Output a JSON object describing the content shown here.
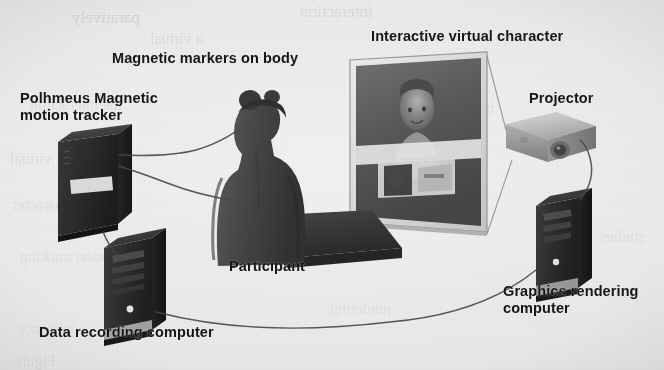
{
  "figure": {
    "type": "system-diagram",
    "medium": "grayscale scanned book figure",
    "background_color": "#eae8e2",
    "ink_color": "#15161a"
  },
  "labels": {
    "magnetic_markers": "Magnetic markers on body",
    "interactive_virtual_character": "Interactive virtual character",
    "motion_tracker": "Polhmeus Magnetic\nmotion tracker",
    "projector": "Projector",
    "participant": "Participant",
    "data_recording_computer": "Data recording computer",
    "graphics_rendering_computer": "Graphics rendering\ncomputer"
  },
  "components": [
    {
      "id": "motion-tracker",
      "label": "Polhmeus Magnetic motion tracker",
      "color": "#2e2d2c"
    },
    {
      "id": "data-recording-computer",
      "label": "Data recording computer",
      "color": "#262524"
    },
    {
      "id": "participant",
      "label": "Participant",
      "color": "#4a4542"
    },
    {
      "id": "projection-screen",
      "label": "Interactive virtual character",
      "color": "#5b5754"
    },
    {
      "id": "projector",
      "label": "Projector",
      "color": "#b9b6b0"
    },
    {
      "id": "graphics-rendering-computer",
      "label": "Graphics rendering computer",
      "color": "#262524"
    },
    {
      "id": "platform",
      "label": "Platform",
      "color": "#3a3836"
    }
  ],
  "connections": [
    {
      "from": "participant",
      "to": "motion-tracker",
      "kind": "marker-cable-upper"
    },
    {
      "from": "participant",
      "to": "motion-tracker",
      "kind": "marker-cable-lower"
    },
    {
      "from": "motion-tracker",
      "to": "data-recording-computer",
      "kind": "data-cable"
    },
    {
      "from": "data-recording-computer",
      "to": "graphics-rendering-computer",
      "kind": "long-data-cable"
    },
    {
      "from": "graphics-rendering-computer",
      "to": "projector",
      "kind": "video-cable"
    },
    {
      "from": "projector",
      "to": "projection-screen",
      "kind": "projection-beam"
    }
  ],
  "bleed_text": [
    {
      "text": "paratively",
      "x": 72,
      "y": 8,
      "size": 17,
      "rot": 0,
      "op": 0.5
    },
    {
      "text": "interaction",
      "x": 300,
      "y": 2,
      "size": 17,
      "rot": 0,
      "op": 0.45
    },
    {
      "text": "a virtual",
      "x": 150,
      "y": 30,
      "size": 16,
      "rot": 0,
      "op": 0.35
    },
    {
      "text": "the interaction",
      "x": 30,
      "y": 96,
      "size": 16,
      "rot": 0,
      "op": 0.3
    },
    {
      "text": "behaviour",
      "x": 430,
      "y": 100,
      "size": 16,
      "rot": 0,
      "op": 0.3
    },
    {
      "text": "virtual",
      "x": 10,
      "y": 150,
      "size": 16,
      "rot": 0,
      "op": 0.3
    },
    {
      "text": "experimental",
      "x": 350,
      "y": 172,
      "size": 16,
      "rot": 0,
      "op": 0.26
    },
    {
      "text": "character",
      "x": 12,
      "y": 196,
      "size": 16,
      "rot": 0,
      "op": 0.3
    },
    {
      "text": "motion tracking",
      "x": 20,
      "y": 248,
      "size": 16,
      "rot": 0,
      "op": 0.3
    },
    {
      "text": "studies",
      "x": 600,
      "y": 228,
      "size": 16,
      "rot": 0,
      "op": 0.26
    },
    {
      "text": "rendering",
      "x": 330,
      "y": 300,
      "size": 16,
      "rot": 0,
      "op": 0.24
    },
    {
      "text": "presence",
      "x": 18,
      "y": 320,
      "size": 16,
      "rot": 0,
      "op": 0.26
    },
    {
      "text": "Figure",
      "x": 14,
      "y": 352,
      "size": 16,
      "rot": 0,
      "op": 0.3
    }
  ]
}
